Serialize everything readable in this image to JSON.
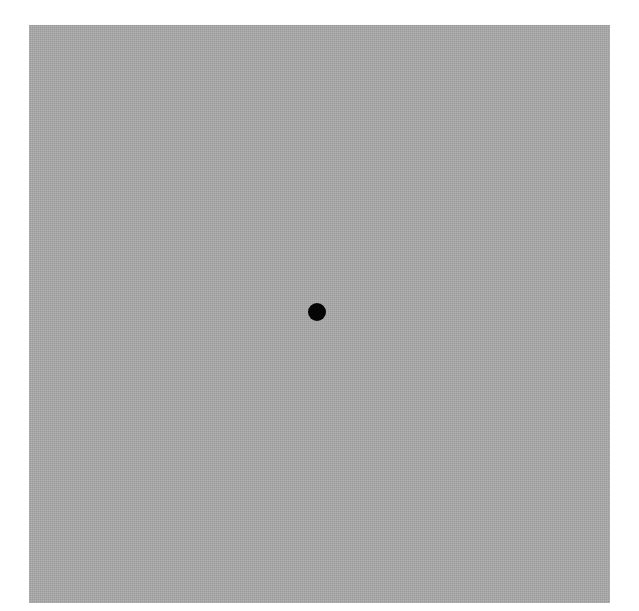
{
  "image": {
    "background_color": "#ffffff",
    "field": {
      "color": "#a9a9a9",
      "left": 29,
      "top": 25,
      "width": 581,
      "height": 578
    },
    "fixation_dot": {
      "color": "#050505",
      "center_x": 317,
      "center_y": 312,
      "diameter": 18
    }
  }
}
